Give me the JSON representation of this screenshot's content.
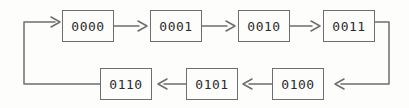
{
  "diagram": {
    "type": "flow-sequence",
    "canvas": {
      "width": 409,
      "height": 108
    },
    "style": {
      "background_color": "#fdfdfc",
      "line_color": "#6e6e70",
      "box_border_color": "#6e6e70",
      "box_fill_color": "#fdfdfc",
      "text_color": "#2b2b2d",
      "stroke_width": 1.5,
      "arrowhead_style": "open-chevron"
    },
    "nodes": [
      {
        "id": "n0",
        "label": "0000",
        "row": "top",
        "x": 62,
        "y": 10,
        "w": 52,
        "h": 32
      },
      {
        "id": "n1",
        "label": "0001",
        "row": "top",
        "x": 150,
        "y": 10,
        "w": 52,
        "h": 32
      },
      {
        "id": "n2",
        "label": "0010",
        "row": "top",
        "x": 238,
        "y": 10,
        "w": 52,
        "h": 32
      },
      {
        "id": "n3",
        "label": "0011",
        "row": "top",
        "x": 323,
        "y": 10,
        "w": 52,
        "h": 32
      },
      {
        "id": "n4",
        "label": "0100",
        "row": "bottom",
        "x": 272,
        "y": 68,
        "w": 52,
        "h": 32
      },
      {
        "id": "n5",
        "label": "0101",
        "row": "bottom",
        "x": 186,
        "y": 68,
        "w": 52,
        "h": 32
      },
      {
        "id": "n6",
        "label": "0110",
        "row": "bottom",
        "x": 100,
        "y": 68,
        "w": 52,
        "h": 32
      }
    ],
    "edges": [
      {
        "id": "e-in",
        "from": "n6",
        "to": "n0",
        "direction": "right",
        "kind": "wrap-left"
      },
      {
        "id": "e-0-1",
        "from": "n0",
        "to": "n1",
        "direction": "right",
        "kind": "straight"
      },
      {
        "id": "e-1-2",
        "from": "n1",
        "to": "n2",
        "direction": "right",
        "kind": "straight"
      },
      {
        "id": "e-2-3",
        "from": "n2",
        "to": "n3",
        "direction": "right",
        "kind": "straight"
      },
      {
        "id": "e-3-4",
        "from": "n3",
        "to": "n4",
        "direction": "left",
        "kind": "wrap-right"
      },
      {
        "id": "e-4-5",
        "from": "n4",
        "to": "n5",
        "direction": "left",
        "kind": "straight"
      },
      {
        "id": "e-5-6",
        "from": "n5",
        "to": "n6",
        "direction": "left",
        "kind": "straight"
      }
    ]
  }
}
